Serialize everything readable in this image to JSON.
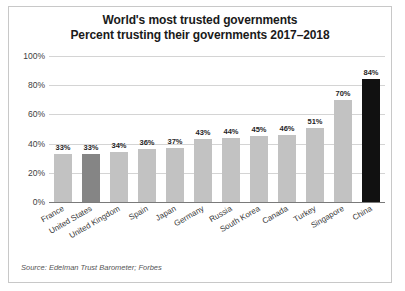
{
  "chart_data": {
    "type": "bar",
    "title": "World's most trusted governments",
    "subtitle": "Percent trusting their governments 2017–2018",
    "xlabel": "",
    "ylabel": "",
    "ylim": [
      0,
      100
    ],
    "grid": true,
    "legend": null,
    "categories": [
      "France",
      "United States",
      "United Kingdom",
      "Spain",
      "Japan",
      "Germany",
      "Russia",
      "South Korea",
      "Canada",
      "Turkey",
      "Singapore",
      "China"
    ],
    "values": [
      33,
      33,
      34,
      36,
      37,
      43,
      44,
      45,
      46,
      51,
      70,
      84
    ],
    "value_labels": [
      "33%",
      "33%",
      "34%",
      "36%",
      "37%",
      "43%",
      "44%",
      "45%",
      "46%",
      "51%",
      "70%",
      "84%"
    ],
    "bar_colors": [
      "#c2c2c2",
      "#858585",
      "#c2c2c2",
      "#c2c2c2",
      "#c2c2c2",
      "#c2c2c2",
      "#c2c2c2",
      "#c2c2c2",
      "#c2c2c2",
      "#c2c2c2",
      "#c2c2c2",
      "#111111"
    ],
    "ytick_labels": [
      "0%",
      "20%",
      "40%",
      "60%",
      "80%",
      "100%"
    ],
    "ytick_values": [
      0,
      20,
      40,
      60,
      80,
      100
    ]
  },
  "source": {
    "text": "Source: Edelman Trust Barometer; Forbes"
  }
}
